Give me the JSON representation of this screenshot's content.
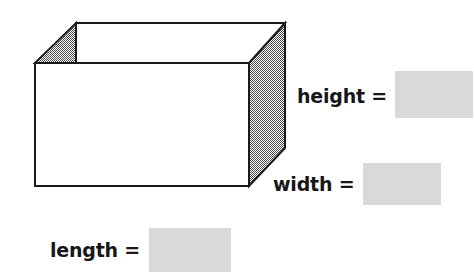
{
  "page": {
    "background_color": "#ffffff",
    "width": 474,
    "height": 273
  },
  "figure": {
    "name": "open-rectangular-box",
    "outline_color": "#1a1a1a",
    "front_face_color": "#ffffff",
    "shaded_face_color": "#9a9a9a",
    "stroke_width": 2
  },
  "labels": [
    {
      "id": "height",
      "text": "height =",
      "blank_fill": "#d9d9d9",
      "answer": ""
    },
    {
      "id": "width",
      "text": "width =",
      "blank_fill": "#d9d9d9",
      "answer": ""
    },
    {
      "id": "length",
      "text": "length =",
      "blank_fill": "#d9d9d9",
      "answer": ""
    }
  ]
}
